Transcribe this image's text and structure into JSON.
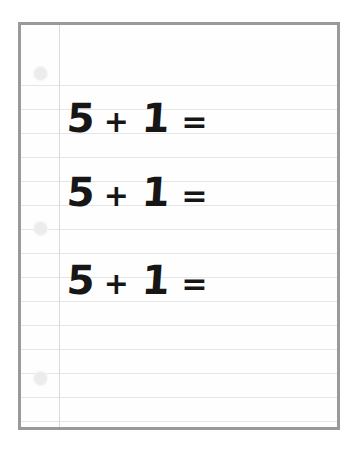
{
  "page": {
    "background_color": "#ffffff"
  },
  "paper": {
    "border_color": "#9a9a9a",
    "surface_color": "#fefefe",
    "rule_color": "#e4e6e8",
    "margin_line_color": "#d8dadc",
    "hole_color": "#ececec",
    "ink_color": "#161616",
    "rule_count": 16,
    "rule_spacing_px": 24,
    "first_rule_y_px": 60,
    "margin_line_x_px": 38,
    "holes": [
      {
        "label": "punch-hole-top",
        "x_px": 13,
        "y_px": 42
      },
      {
        "label": "punch-hole-middle",
        "x_px": 13,
        "y_px": 197
      },
      {
        "label": "punch-hole-bottom",
        "x_px": 13,
        "y_px": 347
      }
    ]
  },
  "equations": [
    {
      "id": "equation-1",
      "text": "5 + 1 =",
      "left_operand": "5",
      "operator": "+",
      "right_operand": "1",
      "equals": "=",
      "answer": "",
      "top_px": 73
    },
    {
      "id": "equation-2",
      "text": "5 + 1 =",
      "left_operand": "5",
      "operator": "+",
      "right_operand": "1",
      "equals": "=",
      "answer": "",
      "top_px": 147
    },
    {
      "id": "equation-3",
      "text": "5 + 1 =",
      "left_operand": "5",
      "operator": "+",
      "right_operand": "1",
      "equals": "=",
      "answer": "",
      "top_px": 235
    }
  ]
}
